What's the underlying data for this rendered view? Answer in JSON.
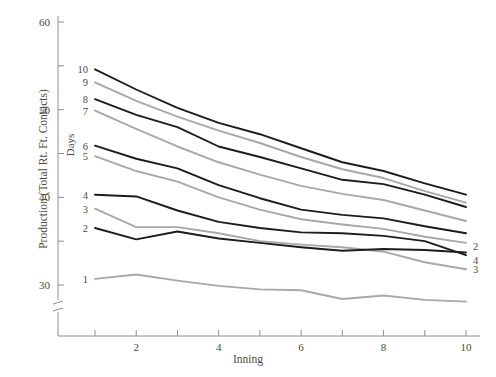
{
  "chart_data": {
    "type": "line",
    "title": "",
    "xlabel": "Inning",
    "ylabel": "Production (Total Rt. Ft. Contacts)",
    "legend_title": "Days",
    "legend_position": "inline-left-and-right",
    "grid": false,
    "x": [
      1,
      2,
      3,
      4,
      5,
      6,
      7,
      8,
      9,
      10
    ],
    "xlim": [
      0.4,
      10.4
    ],
    "ylim": [
      27.2,
      61.5
    ],
    "x_ticks": [
      1,
      2,
      3,
      4,
      5,
      6,
      7,
      8,
      9,
      10
    ],
    "x_tick_labels": [
      "",
      "2",
      "",
      "4",
      "",
      "6",
      "",
      "8",
      "",
      "10"
    ],
    "y_ticks": [
      30,
      35,
      40,
      45,
      50,
      55,
      60
    ],
    "y_tick_labels": [
      "30",
      "",
      "40",
      "",
      "50",
      "",
      "60"
    ],
    "y_axis_break": true,
    "series": [
      {
        "name": "10",
        "color": "#1c1c1c",
        "values": [
          54.6,
          52.3,
          50.2,
          48.5,
          47.2,
          45.6,
          44.0,
          43.0,
          41.6,
          40.3
        ]
      },
      {
        "name": "9",
        "color": "#a8a8a8",
        "values": [
          53.1,
          51.0,
          49.2,
          47.6,
          46.2,
          44.6,
          43.2,
          42.2,
          40.7,
          39.4
        ]
      },
      {
        "name": "8",
        "color": "#1c1c1c",
        "values": [
          51.2,
          49.4,
          48.0,
          45.8,
          44.6,
          43.3,
          42.0,
          41.5,
          40.3,
          38.9
        ]
      },
      {
        "name": "7",
        "color": "#a8a8a8",
        "values": [
          49.9,
          47.8,
          45.8,
          44.0,
          42.6,
          41.3,
          40.4,
          39.7,
          38.5,
          37.3
        ]
      },
      {
        "name": "6",
        "color": "#1c1c1c",
        "values": [
          45.9,
          44.4,
          43.3,
          41.4,
          39.9,
          38.6,
          38.0,
          37.6,
          36.7,
          35.9
        ]
      },
      {
        "name": "5",
        "color": "#a8a8a8",
        "values": [
          44.7,
          43.0,
          41.8,
          40.0,
          38.6,
          37.5,
          36.9,
          36.4,
          35.5,
          34.8
        ]
      },
      {
        "name": "4",
        "color": "#1c1c1c",
        "values": [
          40.3,
          40.1,
          38.5,
          37.2,
          36.5,
          36.0,
          35.9,
          35.6,
          35.0,
          33.4
        ]
      },
      {
        "name": "3",
        "color": "#a8a8a8",
        "values": [
          38.7,
          36.6,
          36.6,
          35.9,
          35.0,
          34.6,
          34.3,
          33.8,
          32.6,
          31.8
        ]
      },
      {
        "name": "2",
        "color": "#1c1c1c",
        "values": [
          36.5,
          35.2,
          36.1,
          35.3,
          34.8,
          34.3,
          33.9,
          34.1,
          34.0,
          33.7
        ]
      },
      {
        "name": "1",
        "color": "#a8a8a8",
        "values": [
          30.7,
          31.2,
          30.5,
          29.9,
          29.5,
          29.4,
          28.4,
          28.8,
          28.3,
          28.1
        ]
      }
    ],
    "left_labels": [
      "10",
      "9",
      "8",
      "7",
      "6",
      "5",
      "4",
      "3",
      "2",
      "1"
    ],
    "right_labels": [
      "2",
      "4",
      "3"
    ]
  }
}
